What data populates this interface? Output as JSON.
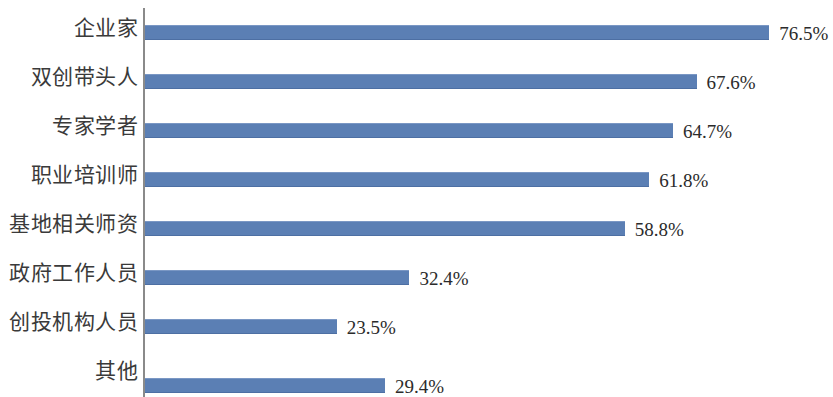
{
  "chart_data": {
    "type": "bar",
    "orientation": "horizontal",
    "title": "",
    "subtitle": "",
    "xlabel": "",
    "ylabel": "",
    "grid": false,
    "legend": false,
    "xlim": [
      0,
      80
    ],
    "value_suffix": "%",
    "bar_color": "#5b7fb4",
    "axis_color": "#8a8a8a",
    "label_color": "#3a3a3a",
    "categories": [
      "企业家",
      "双创带头人",
      "专家学者",
      "职业培训师",
      "基地相关师资",
      "政府工作人员",
      "创投机构人员",
      "其他"
    ],
    "values": [
      76.5,
      67.6,
      64.7,
      61.8,
      58.8,
      32.4,
      23.5,
      29.4
    ],
    "value_labels": [
      "76.5%",
      "67.6%",
      "64.7%",
      "61.8%",
      "58.8%",
      "32.4%",
      "23.5%",
      "29.4%"
    ]
  }
}
